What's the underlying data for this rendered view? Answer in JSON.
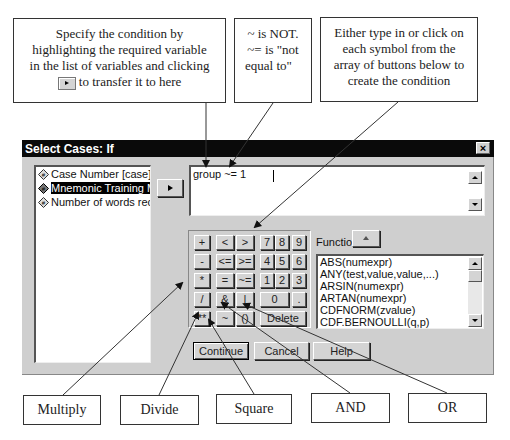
{
  "callouts_top": {
    "condition": {
      "line1": "Specify the condition by",
      "line2": "highlighting the required variable",
      "line3": "in the list of variables and clicking",
      "line4": "to transfer it to here"
    },
    "not_equal": {
      "line1": "~ is NOT.",
      "line2": "~= is \"not",
      "line3": "equal to\""
    },
    "buttons_hint": {
      "line1": "Either type in or click on",
      "line2": "each symbol from the",
      "line3": "array of buttons below to",
      "line4": "create the condition"
    }
  },
  "callouts_bottom": {
    "multiply": "Multiply",
    "divide": "Divide",
    "square": "Square",
    "and": "AND",
    "or": "OR"
  },
  "dialog": {
    "title": "Select Cases: If",
    "close_label": "×",
    "variables": [
      {
        "label": "Case Number [case]",
        "selected": false
      },
      {
        "label": "Mnemonic Training Me",
        "selected": true
      },
      {
        "label": "Number of words recal",
        "selected": false
      }
    ],
    "expression": "group ~= 1",
    "keypad": {
      "keys": [
        "+",
        "<",
        ">",
        "7",
        "8",
        "9",
        "-",
        "<=",
        ">=",
        "4",
        "5",
        "6",
        "*",
        "=",
        "~=",
        "1",
        "2",
        "3",
        "/",
        "&",
        "|",
        "0",
        ".",
        "**",
        "~",
        "()",
        "Delete"
      ]
    },
    "functions_label": "Functions:",
    "functions": [
      "ABS(numexpr)",
      "ANY(test,value,value,...)",
      "ARSIN(numexpr)",
      "ARTAN(numexpr)",
      "CDFNORM(zvalue)",
      "CDF.BERNOULLI(q,p)"
    ],
    "buttons": {
      "continue": "Continue",
      "cancel": "Cancel",
      "help": "Help"
    }
  },
  "colors": {
    "dialog_bg": "#cfcfcf",
    "titlebar_bg": "#0a0a0a",
    "selection_bg": "#000000"
  }
}
